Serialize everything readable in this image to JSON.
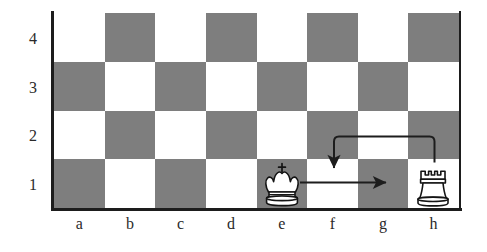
{
  "diagram": {
    "board": {
      "files": [
        "a",
        "b",
        "c",
        "d",
        "e",
        "f",
        "g",
        "h"
      ],
      "ranks": [
        "4",
        "3",
        "2",
        "1"
      ],
      "light_square_color": "#ffffff",
      "dark_square_color": "#7e7e7e",
      "border_color": "#1d1d1d",
      "columns": 8,
      "rows": 4,
      "squares": [
        [
          "light",
          "dark",
          "light",
          "dark",
          "light",
          "dark",
          "light",
          "dark"
        ],
        [
          "dark",
          "light",
          "dark",
          "light",
          "dark",
          "light",
          "dark",
          "light"
        ],
        [
          "light",
          "dark",
          "light",
          "dark",
          "light",
          "dark",
          "light",
          "dark"
        ],
        [
          "dark",
          "light",
          "dark",
          "light",
          "dark",
          "light",
          "dark",
          "light"
        ]
      ]
    },
    "pieces": [
      {
        "name": "white-king",
        "label": "King",
        "square": "e1",
        "file": "e",
        "rank": "1",
        "color": "white"
      },
      {
        "name": "white-rook",
        "label": "Rook",
        "square": "h1",
        "file": "h",
        "rank": "1",
        "color": "white"
      }
    ],
    "arrows": [
      {
        "name": "king-move-arrow",
        "label": "King e1 to g1",
        "from": "e1",
        "to": "g1",
        "style": "straight",
        "direction": "right",
        "color": "#1d1d1d"
      },
      {
        "name": "rook-move-arrow",
        "label": "Rook h1 to f1",
        "from": "h1",
        "to": "f1",
        "style": "curved-over",
        "direction": "down",
        "color": "#1d1d1d"
      }
    ]
  }
}
